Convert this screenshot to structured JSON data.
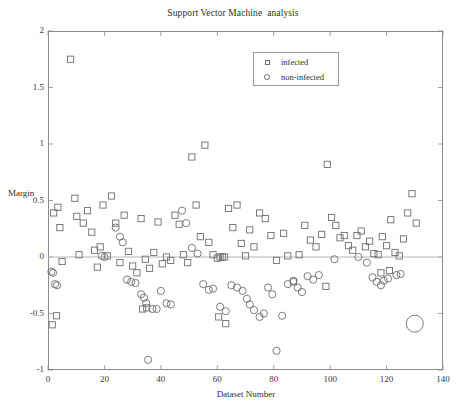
{
  "chart_data": {
    "type": "scatter",
    "title": "Support Vector Machine  analysis",
    "xlabel": "Dataset Number",
    "ylabel": "Margin",
    "xlim": [
      0,
      140
    ],
    "ylim": [
      -1,
      2
    ],
    "xticks": [
      0,
      20,
      40,
      60,
      80,
      100,
      120,
      140
    ],
    "yticks": [
      -1,
      -0.5,
      0,
      0.5,
      1,
      1.5,
      2
    ],
    "xtick_labels": [
      "0",
      "20",
      "40",
      "60",
      "80",
      "100",
      "120",
      "140"
    ],
    "ytick_labels": [
      "-1",
      "-0.5",
      "0",
      "0.5",
      "1",
      "1.5",
      "2"
    ],
    "grid": false,
    "legend_position": "top-center",
    "marker_color": "#6e6e6e",
    "axis_color": "#8c8c8c",
    "zero_line": 0,
    "series": [
      {
        "name": "infected",
        "marker": "square",
        "points": [
          [
            2.0,
            0.39
          ],
          [
            3.5,
            0.44
          ],
          [
            4.2,
            0.26
          ],
          [
            5.0,
            -0.04
          ],
          [
            8.0,
            1.75
          ],
          [
            9.5,
            0.52
          ],
          [
            10.2,
            0.36
          ],
          [
            11.0,
            0.02
          ],
          [
            12.5,
            0.3
          ],
          [
            14.0,
            0.41
          ],
          [
            15.5,
            0.22
          ],
          [
            16.5,
            0.06
          ],
          [
            17.5,
            -0.09
          ],
          [
            18.5,
            0.09
          ],
          [
            19.5,
            0.46
          ],
          [
            21.0,
            0.01
          ],
          [
            22.5,
            0.54
          ],
          [
            24.0,
            0.3
          ],
          [
            25.5,
            -0.05
          ],
          [
            27.0,
            0.37
          ],
          [
            28.5,
            0.05
          ],
          [
            30.0,
            -0.08
          ],
          [
            31.5,
            -0.14
          ],
          [
            33.0,
            0.34
          ],
          [
            34.5,
            -0.02
          ],
          [
            36.0,
            -0.1
          ],
          [
            37.5,
            0.04
          ],
          [
            39.0,
            0.31
          ],
          [
            40.5,
            -0.06
          ],
          [
            42.0,
            0.0
          ],
          [
            43.5,
            -0.03
          ],
          [
            45.0,
            0.37
          ],
          [
            46.5,
            0.29
          ],
          [
            48.0,
            0.02
          ],
          [
            49.5,
            -0.05
          ],
          [
            51.0,
            0.885
          ],
          [
            52.5,
            0.46
          ],
          [
            54.0,
            0.18
          ],
          [
            55.6,
            0.99
          ],
          [
            57.0,
            0.13
          ],
          [
            58.5,
            0.02
          ],
          [
            60.0,
            -0.01
          ],
          [
            61.0,
            0.0
          ],
          [
            61.8,
            0.0
          ],
          [
            62.6,
            0.0
          ],
          [
            64.0,
            0.43
          ],
          [
            65.5,
            0.26
          ],
          [
            67.0,
            0.46
          ],
          [
            68.5,
            0.12
          ],
          [
            70.0,
            0.01
          ],
          [
            71.5,
            0.24
          ],
          [
            73.0,
            0.09
          ],
          [
            75.0,
            0.39
          ],
          [
            77.0,
            0.34
          ],
          [
            79.0,
            0.19
          ],
          [
            81.0,
            -0.03
          ],
          [
            83.5,
            0.21
          ],
          [
            85.0,
            0.01
          ],
          [
            87.0,
            -0.22
          ],
          [
            89.0,
            0.02
          ],
          [
            91.0,
            0.28
          ],
          [
            93.0,
            0.15
          ],
          [
            95.0,
            0.09
          ],
          [
            97.0,
            0.2
          ],
          [
            99.0,
            0.82
          ],
          [
            100.5,
            0.35
          ],
          [
            102.0,
            0.28
          ],
          [
            103.5,
            0.17
          ],
          [
            105.0,
            0.19
          ],
          [
            106.5,
            0.1
          ],
          [
            108.0,
            0.06
          ],
          [
            109.5,
            0.19
          ],
          [
            111.0,
            0.23
          ],
          [
            112.5,
            0.09
          ],
          [
            114.0,
            0.14
          ],
          [
            115.5,
            0.03
          ],
          [
            117.0,
            0.02
          ],
          [
            118.5,
            0.18
          ],
          [
            120.0,
            0.1
          ],
          [
            121.5,
            0.33
          ],
          [
            123.0,
            0.04
          ],
          [
            124.5,
            0.01
          ],
          [
            126.0,
            0.16
          ],
          [
            127.5,
            0.39
          ],
          [
            129.0,
            0.56
          ],
          [
            130.5,
            0.3
          ],
          [
            1.5,
            -0.6
          ],
          [
            33.5,
            -0.46
          ],
          [
            60.5,
            -0.53
          ],
          [
            63.0,
            -0.59
          ],
          [
            98.5,
            -0.26
          ],
          [
            118.0,
            -0.14
          ],
          [
            121.0,
            -0.12
          ],
          [
            35.0,
            -0.45
          ],
          [
            3.0,
            -0.52
          ]
        ]
      },
      {
        "name": "non-infected",
        "marker": "circle",
        "points": [
          [
            1.2,
            -0.13
          ],
          [
            1.8,
            -0.14
          ],
          [
            2.5,
            -0.24
          ],
          [
            3.2,
            -0.25
          ],
          [
            19.0,
            0.01
          ],
          [
            20.0,
            0.0
          ],
          [
            24.0,
            0.26
          ],
          [
            25.5,
            0.18
          ],
          [
            26.5,
            0.13
          ],
          [
            28.0,
            -0.2
          ],
          [
            29.5,
            -0.22
          ],
          [
            31.0,
            -0.23
          ],
          [
            33.0,
            -0.33
          ],
          [
            34.0,
            -0.36
          ],
          [
            34.8,
            -0.41
          ],
          [
            35.5,
            -0.91
          ],
          [
            37.0,
            -0.46
          ],
          [
            38.5,
            -0.46
          ],
          [
            40.0,
            -0.3
          ],
          [
            42.0,
            -0.41
          ],
          [
            43.5,
            -0.42
          ],
          [
            47.5,
            0.41
          ],
          [
            49.0,
            0.3
          ],
          [
            51.0,
            0.08
          ],
          [
            53.0,
            0.03
          ],
          [
            55.0,
            -0.24
          ],
          [
            57.0,
            -0.29
          ],
          [
            58.5,
            -0.28
          ],
          [
            61.0,
            -0.44
          ],
          [
            63.0,
            -0.48
          ],
          [
            65.0,
            -0.25
          ],
          [
            67.0,
            -0.27
          ],
          [
            69.0,
            -0.3
          ],
          [
            70.5,
            -0.37
          ],
          [
            71.5,
            -0.42
          ],
          [
            73.0,
            -0.47
          ],
          [
            75.0,
            -0.53
          ],
          [
            76.5,
            -0.5
          ],
          [
            78.0,
            -0.27
          ],
          [
            79.5,
            -0.33
          ],
          [
            81.0,
            -0.83
          ],
          [
            83.0,
            -0.52
          ],
          [
            85.0,
            -0.24
          ],
          [
            87.0,
            -0.21
          ],
          [
            88.5,
            -0.27
          ],
          [
            90.0,
            -0.31
          ],
          [
            92.0,
            -0.17
          ],
          [
            94.0,
            -0.2
          ],
          [
            96.0,
            -0.16
          ],
          [
            101.5,
            -0.02
          ],
          [
            110.0,
            0.0
          ],
          [
            113.0,
            -0.05
          ],
          [
            115.0,
            -0.18
          ],
          [
            116.5,
            -0.22
          ],
          [
            118.0,
            -0.25
          ],
          [
            119.0,
            -0.21
          ],
          [
            120.5,
            -0.19
          ],
          [
            123.5,
            -0.16
          ],
          [
            125.0,
            -0.15
          ],
          [
            130.0,
            -0.59
          ]
        ]
      }
    ]
  },
  "legend": {
    "items": [
      {
        "label": "infected",
        "marker": "square"
      },
      {
        "label": "non-infected",
        "marker": "circle"
      }
    ]
  }
}
